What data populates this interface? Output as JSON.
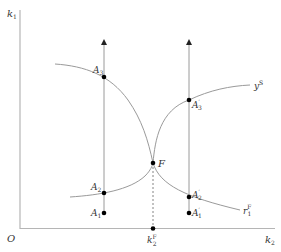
{
  "diagram": {
    "axes": {
      "y_label": "k",
      "y_label_sub": "1",
      "x_label": "k",
      "x_label_sub": "2",
      "origin_label": "O"
    },
    "curves": {
      "supply_curve_label": "y",
      "supply_curve_sup": "S",
      "reaction_curve_label": "r",
      "reaction_curve_sub": "1",
      "reaction_curve_sup": "F"
    },
    "points": {
      "A3": {
        "name": "A",
        "sub": "3",
        "prime": ""
      },
      "A2": {
        "name": "A",
        "sub": "2",
        "prime": ""
      },
      "A1": {
        "name": "A",
        "sub": "1",
        "prime": ""
      },
      "A3p": {
        "name": "A",
        "sub": "3",
        "prime": "′"
      },
      "A2p": {
        "name": "A",
        "sub": "2",
        "prime": "′"
      },
      "A1p": {
        "name": "A",
        "sub": "1",
        "prime": "′"
      },
      "F": {
        "name": "F"
      }
    },
    "tick": {
      "k2F_label": "k",
      "k2F_sub": "2",
      "k2F_sup": "F"
    },
    "colors": {
      "line": "#9a9a9a",
      "axis": "#b0b0b0",
      "point": "#000000",
      "text": "#333333"
    }
  }
}
